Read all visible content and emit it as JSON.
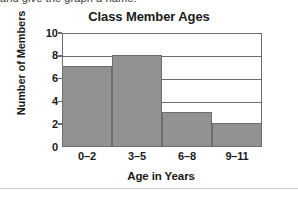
{
  "page": {
    "clipped_instruction": "and give the graph a name."
  },
  "chart_data": {
    "type": "bar",
    "title": "Class Member Ages",
    "xlabel": "Age in Years",
    "ylabel": "Number of Members",
    "categories": [
      "0–2",
      "3–5",
      "6–8",
      "9–11"
    ],
    "values": [
      7,
      8,
      3,
      2
    ],
    "ylim": [
      0,
      10
    ],
    "yticks": [
      0,
      2,
      4,
      6,
      8,
      10
    ],
    "ytick_labels": [
      "0",
      "2",
      "4",
      "6",
      "8",
      "10"
    ],
    "grid": "horizontal",
    "legend": "none",
    "bar_color": "#929292",
    "axis_color": "#6d6d6d",
    "text_color": "#1a1a1a",
    "background": "#ffffff"
  }
}
